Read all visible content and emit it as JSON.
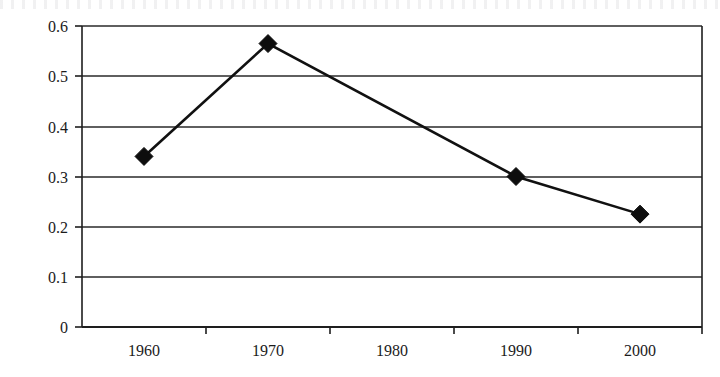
{
  "chart_data": {
    "type": "line",
    "title": "",
    "xlabel": "",
    "ylabel": "",
    "categories": [
      "1960",
      "1970",
      "1980",
      "1990",
      "2000"
    ],
    "series": [
      {
        "name": "series-1",
        "values": [
          0.34,
          0.565,
          null,
          0.3,
          0.225
        ],
        "marker": "diamond",
        "color": "#111111"
      }
    ],
    "x_tick_labels": [
      "1960",
      "1970",
      "1980",
      "1990",
      "2000"
    ],
    "y_tick_labels": [
      "0.6",
      "0.5",
      "0.4",
      "0.3",
      "0.2",
      "0.1",
      "0"
    ],
    "y_tick_values": [
      0.6,
      0.5,
      0.4,
      0.3,
      0.2,
      0.1,
      0
    ],
    "ylim": [
      0,
      0.6
    ],
    "grid": "horizontal",
    "legend": "none",
    "note": "1980 category has no data marker; the connecting line passes straight from 1970 to 1990"
  },
  "axes": {
    "y_axis_name": "value-axis",
    "x_axis_name": "category-axis"
  }
}
